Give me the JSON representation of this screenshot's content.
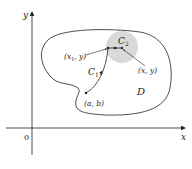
{
  "diagram": {
    "axes": {
      "x_label": "x",
      "y_label": "y",
      "origin_label": "0"
    },
    "region_label": "D",
    "curves": {
      "c1_label": "C",
      "c1_sub": "1",
      "c2_label": "C",
      "c2_sub": "2"
    },
    "points": {
      "start": "(a, b)",
      "mid_x": "(x",
      "mid_sub": "1",
      "mid_rest": ", y)",
      "end": "(x, y)"
    },
    "colors": {
      "line": "#222222",
      "disk_fill": "#d9d9d9"
    }
  }
}
